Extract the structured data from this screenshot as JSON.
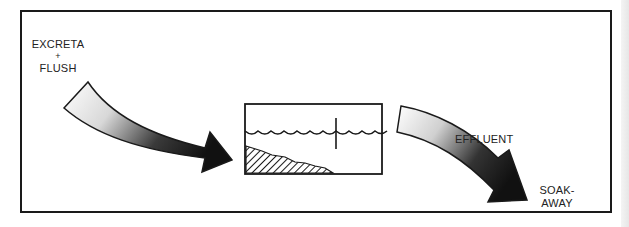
{
  "diagram": {
    "labels": {
      "input_line1": "EXCRETA",
      "input_plus": "+",
      "input_line2": "FLUSH",
      "effluent": "EFFLUENT",
      "output_line1": "SOAK-",
      "output_line2": "AWAY"
    },
    "components": [
      {
        "id": "inflow-arrow",
        "description": "Curved stippled arrow from excreta + flush into tank"
      },
      {
        "id": "septic-tank",
        "description": "Rectangular tank with wavy water surface, baffle and hatched sludge layer"
      },
      {
        "id": "outflow-arrow",
        "description": "Curved stippled arrow carrying effluent to soak-away"
      }
    ],
    "colors": {
      "ink": "#1a1a1a",
      "background": "#ffffff"
    }
  }
}
